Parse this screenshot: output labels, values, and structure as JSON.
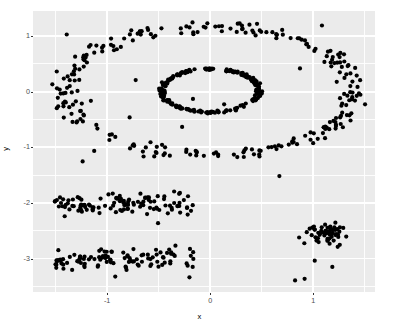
{
  "chart_data": {
    "type": "scatter",
    "title": "",
    "subtitle": "",
    "xlabel": "x",
    "ylabel": "y",
    "xlim": [
      -1.72,
      1.6
    ],
    "ylim": [
      -3.6,
      1.45
    ],
    "xticks": [
      -1,
      0,
      1
    ],
    "xtick_labels": [
      "-1",
      "0",
      "1"
    ],
    "xticks_minor": [
      -1.5,
      -0.5,
      0.5,
      1.5
    ],
    "yticks": [
      1,
      0,
      -1,
      -2,
      -3
    ],
    "ytick_labels": [
      "1",
      "0",
      "-1",
      "-2",
      "-3"
    ],
    "yticks_minor": [
      1.5,
      0.5,
      -0.5,
      -1.5,
      -2.5,
      -3.5
    ],
    "grid": true,
    "grid_color": "#ffffff",
    "panel_background": "#ebebeb",
    "legend": "none",
    "point_color": "#000000",
    "point_size": 2.1,
    "point_shape": "circle",
    "n_points": 640,
    "series": [
      {
        "name": "outer-ring",
        "shape": "ellipse-ring",
        "cx": 0.0,
        "cy": 0.02,
        "rx": 1.4,
        "ry": 1.14,
        "jitter": 0.075,
        "n": 260,
        "values": []
      },
      {
        "name": "inner-ring",
        "shape": "ellipse-ring",
        "cx": 0.0,
        "cy": 0.02,
        "rx": 0.47,
        "ry": 0.39,
        "jitter": 0.032,
        "n": 200,
        "values": []
      },
      {
        "name": "upper-band",
        "shape": "horizontal-band",
        "x_range": [
          -1.52,
          -0.16
        ],
        "y_center": -2.02,
        "y_spread": 0.17,
        "n": 110,
        "values": []
      },
      {
        "name": "lower-band",
        "shape": "horizontal-band",
        "x_range": [
          -1.52,
          -0.16
        ],
        "y_center": -3.02,
        "y_spread": 0.17,
        "n": 105,
        "values": []
      },
      {
        "name": "right-blob",
        "shape": "gaussian-blob",
        "cx": 1.13,
        "cy": -2.55,
        "sx": 0.1,
        "sy": 0.09,
        "n": 55,
        "values": []
      },
      {
        "name": "scattered-noise",
        "shape": "uniform-noise",
        "x_range": [
          -1.6,
          1.48
        ],
        "y_range": [
          -3.45,
          1.3
        ],
        "n": 25,
        "values": []
      }
    ]
  },
  "axes": {
    "x_title": "x",
    "y_title": "y",
    "x_tick_labels": [
      "-1",
      "0",
      "1"
    ],
    "y_tick_labels": [
      "1",
      "0",
      "-1",
      "-2",
      "-3"
    ]
  }
}
